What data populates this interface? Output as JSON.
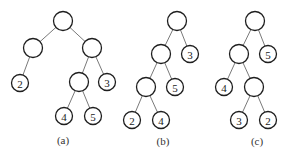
{
  "figure": {
    "trees": [
      {
        "id": "a",
        "caption": "(a)",
        "caption_pos": [
          63,
          140
        ],
        "nodes": [
          {
            "id": "a0",
            "x": 63,
            "y": 21,
            "label": ""
          },
          {
            "id": "a1",
            "x": 33,
            "y": 48,
            "label": ""
          },
          {
            "id": "a2",
            "x": 92,
            "y": 48,
            "label": ""
          },
          {
            "id": "a3",
            "x": 20,
            "y": 83,
            "label": "2"
          },
          {
            "id": "a4",
            "x": 79,
            "y": 82,
            "label": ""
          },
          {
            "id": "a5",
            "x": 107,
            "y": 82,
            "label": "3"
          },
          {
            "id": "a6",
            "x": 64,
            "y": 116,
            "label": "4"
          },
          {
            "id": "a7",
            "x": 93,
            "y": 116,
            "label": "5"
          }
        ],
        "edges": [
          [
            "a0",
            "a1"
          ],
          [
            "a0",
            "a2"
          ],
          [
            "a1",
            "a3"
          ],
          [
            "a2",
            "a4"
          ],
          [
            "a2",
            "a5"
          ],
          [
            "a4",
            "a6"
          ],
          [
            "a4",
            "a7"
          ]
        ]
      },
      {
        "id": "b",
        "caption": "(b)",
        "caption_pos": [
          163,
          141
        ],
        "nodes": [
          {
            "id": "b0",
            "x": 177,
            "y": 21,
            "label": ""
          },
          {
            "id": "b1",
            "x": 161,
            "y": 54,
            "label": ""
          },
          {
            "id": "b2",
            "x": 190,
            "y": 54,
            "label": "3"
          },
          {
            "id": "b3",
            "x": 146,
            "y": 87,
            "label": ""
          },
          {
            "id": "b4",
            "x": 175,
            "y": 87,
            "label": "5"
          },
          {
            "id": "b5",
            "x": 132,
            "y": 120,
            "label": "2"
          },
          {
            "id": "b6",
            "x": 161,
            "y": 120,
            "label": "4"
          }
        ],
        "edges": [
          [
            "b0",
            "b1"
          ],
          [
            "b0",
            "b2"
          ],
          [
            "b1",
            "b3"
          ],
          [
            "b1",
            "b4"
          ],
          [
            "b3",
            "b5"
          ],
          [
            "b3",
            "b6"
          ]
        ]
      },
      {
        "id": "c",
        "caption": "(c)",
        "caption_pos": [
          257,
          141
        ],
        "nodes": [
          {
            "id": "c0",
            "x": 255,
            "y": 21,
            "label": ""
          },
          {
            "id": "c1",
            "x": 239,
            "y": 54,
            "label": ""
          },
          {
            "id": "c2",
            "x": 268,
            "y": 54,
            "label": "5"
          },
          {
            "id": "c3",
            "x": 224,
            "y": 87,
            "label": "4"
          },
          {
            "id": "c4",
            "x": 254,
            "y": 87,
            "label": ""
          },
          {
            "id": "c5",
            "x": 239,
            "y": 120,
            "label": "3"
          },
          {
            "id": "c6",
            "x": 268,
            "y": 120,
            "label": "2"
          }
        ],
        "edges": [
          [
            "c0",
            "c1"
          ],
          [
            "c0",
            "c2"
          ],
          [
            "c1",
            "c3"
          ],
          [
            "c1",
            "c4"
          ],
          [
            "c4",
            "c5"
          ],
          [
            "c4",
            "c6"
          ]
        ]
      }
    ],
    "node_radius_internal": 9.5,
    "node_radius_leaf": 8.5
  }
}
